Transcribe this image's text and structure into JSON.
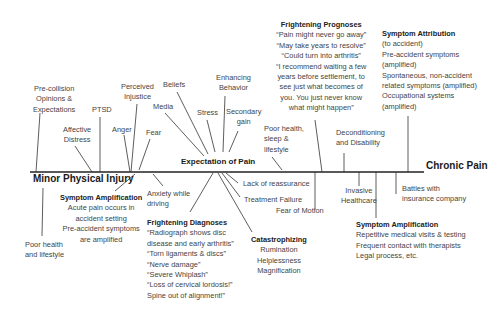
{
  "diagram": {
    "main_axis": {
      "start": "Minor Physical Injury",
      "end": "Chronic Pain",
      "center": "Expectation of Pain"
    },
    "top_factors_left": [
      {
        "label": [
          "Pre-collision",
          "Opinions &",
          "Expectations"
        ]
      },
      {
        "label": [
          "Affective",
          "Distress"
        ]
      },
      {
        "label": [
          "PTSD"
        ]
      },
      {
        "label": [
          "Anger"
        ]
      },
      {
        "label": [
          "Perceived",
          "Injustice"
        ]
      },
      {
        "label": [
          "Fear"
        ]
      },
      {
        "label": [
          "Media"
        ]
      },
      {
        "label": [
          "Beliefs"
        ]
      },
      {
        "label": [
          "Stress"
        ]
      },
      {
        "label": [
          "Enhancing",
          "Behavior"
        ]
      },
      {
        "label": [
          "Secondary",
          "gain"
        ]
      }
    ],
    "top_factors_right": [
      {
        "label": [
          "Poor health,",
          "sleep &",
          "lifestyle"
        ]
      },
      {
        "label": [
          "Deconditioning",
          "and Disability"
        ]
      }
    ],
    "frightening_prognoses": {
      "title": "Frightening Prognoses",
      "lines": [
        "“Pain might never go away”",
        "“May take years to resolve”",
        "“Could turn into arthritis”",
        "“I recommend waiting a few",
        "years before settlement, to",
        "see just what becomes of",
        "you. You just never know",
        "what might happen”"
      ]
    },
    "symptom_attribution": {
      "title": "Symptom Attribution",
      "lines": [
        "(to accident)",
        "Pre-accident symptoms",
        "(amplified)",
        "Spontaneous, non-accident",
        "related symptoms (amplified)",
        "Occupational systems",
        "(amplified)"
      ]
    },
    "bottom_left": {
      "poor_health": [
        "Poor health",
        "and lifestyle"
      ],
      "symptom_amplification": {
        "title": "Symptom Amplification",
        "lines": [
          "Acute pain occurs in",
          "accident setting",
          "Pre-accident symptoms",
          "are amplified"
        ]
      },
      "anxiety": [
        "Anxiety while",
        "driving"
      ]
    },
    "frightening_diagnoses": {
      "title": "Frightening Diagnoses",
      "lines": [
        "“Radiograph shows disc",
        "disease and early arthritis”",
        "“Torn ligaments & discs”",
        "“Nerve damage”",
        "“Severe Whiplash”",
        "“Loss of cervical lordosis!”",
        "Spine out of alignment!”"
      ]
    },
    "bottom_center": {
      "lack_of_reassurance": "Lack of reassurance",
      "treatment_failure": "Treatment Failure",
      "fear_of_motion": "Fear of Motion"
    },
    "catastrophizing": {
      "title": "Catastrophizing",
      "lines": [
        "Rumination",
        "Helplessness",
        "Magnification"
      ]
    },
    "bottom_right": {
      "invasive_healthcare": [
        "Invasive",
        "Healthcare"
      ],
      "battles": [
        "Battles with",
        "insurance company"
      ]
    },
    "symptom_amplification_right": {
      "title": "Symptom Amplification",
      "lines": [
        "Repetitive medical visits & testing",
        "Frequent contact with therapists",
        "Legal process, etc."
      ]
    }
  }
}
